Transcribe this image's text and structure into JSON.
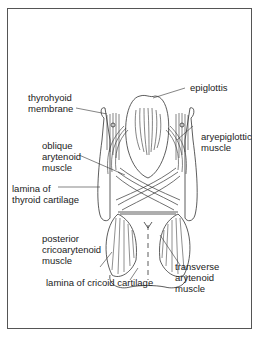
{
  "diagram": {
    "labels": {
      "epiglottis": "epiglottis",
      "thyrohyoid_membrane": [
        "thyrohyoid",
        "membrane"
      ],
      "aryepiglottic_muscle": [
        "aryepiglottic",
        "muscle"
      ],
      "oblique_arytenoid_muscle": [
        "oblique",
        "arytenoid",
        "muscle"
      ],
      "lamina_of_thyroid_cartilage": [
        "lamina of",
        "thyroid cartilage"
      ],
      "posterior_cricoarytenoid_muscle": [
        "posterior",
        "cricoarytenoid",
        "muscle"
      ],
      "lamina_of_cricoid_cartilage": "lamina of cricoid cartilage",
      "transverse_arytenoid_muscle": [
        "transverse",
        "arytenoid",
        "muscle"
      ]
    },
    "colors": {
      "line": "#333333",
      "frame": "#555555",
      "background": "#ffffff"
    }
  }
}
